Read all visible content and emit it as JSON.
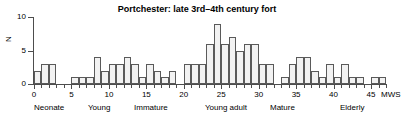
{
  "chart_data": {
    "type": "bar",
    "title": "Portchester: late 3rd–4th century fort",
    "xlabel": "MWS",
    "ylabel": "N",
    "ylim": [
      0,
      10
    ],
    "xlim": [
      0,
      47
    ],
    "grid": false,
    "legend": null,
    "bar_width": 1,
    "y_ticks": [
      0,
      5,
      10
    ],
    "y_tick_labels": [
      "0",
      "5",
      "10"
    ],
    "x_ticks": [
      0,
      5,
      10,
      15,
      20,
      25,
      30,
      35,
      40,
      45
    ],
    "x_tick_labels": [
      "0",
      "5",
      "10",
      "15",
      "20",
      "25",
      "30",
      "35",
      "40",
      "45"
    ],
    "x_minor_tick_step": 1,
    "categories": [
      "0-1",
      "1-2",
      "2-3",
      "3-4",
      "4-5",
      "5-6",
      "6-7",
      "7-8",
      "8-9",
      "9-10",
      "10-11",
      "11-12",
      "12-13",
      "13-14",
      "14-15",
      "15-16",
      "16-17",
      "17-18",
      "18-19",
      "19-20",
      "20-21",
      "21-22",
      "22-23",
      "23-24",
      "24-25",
      "25-26",
      "26-27",
      "27-28",
      "28-29",
      "29-30",
      "30-31",
      "31-32",
      "32-33",
      "33-34",
      "34-35",
      "35-36",
      "36-37",
      "37-38",
      "38-39",
      "39-40",
      "40-41",
      "41-42",
      "42-43",
      "43-44",
      "44-45",
      "45-46",
      "46-47"
    ],
    "values": [
      2,
      3,
      3,
      0,
      0,
      1,
      1,
      1,
      4,
      2,
      3,
      3,
      4,
      3,
      1,
      3,
      2,
      1,
      2,
      0,
      3,
      3,
      3,
      6,
      9,
      6,
      7,
      5,
      6,
      6,
      3,
      3,
      0,
      1,
      3,
      4,
      4,
      2,
      1,
      3,
      1,
      3,
      1,
      1,
      0,
      1,
      1
    ],
    "annotations": [
      {
        "text": "Neonate",
        "x_start": 0,
        "x_end": 2
      },
      {
        "text": "Young",
        "x_start": 3,
        "x_end": 6
      },
      {
        "text": "Immature",
        "x_start": 8,
        "x_end": 14
      },
      {
        "text": "Young adult",
        "x_start": 19,
        "x_end": 25
      },
      {
        "text": "Mature",
        "x_start": 27,
        "x_end": 32
      },
      {
        "text": "Elderly",
        "x_start": 41,
        "x_end": 45
      }
    ],
    "colors": {
      "bar_fill": "#f2f2f2",
      "bar_edge": "#5a5a5a",
      "axis": "#4d4d4d",
      "text": "#000000",
      "background": "#ffffff"
    }
  },
  "axis": {
    "y_label": "N",
    "x_unit_label": "MWS"
  },
  "stage_labels": [
    {
      "label": "Neonate",
      "left": 34
    },
    {
      "label": "Young",
      "left": 88
    },
    {
      "label": "Immature",
      "left": 134
    },
    {
      "label": "Young adult",
      "left": 205
    },
    {
      "label": "Mature",
      "left": 270
    },
    {
      "label": "Elderly",
      "left": 340
    }
  ]
}
